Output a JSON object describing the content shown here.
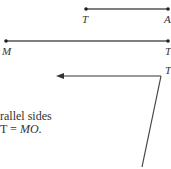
{
  "diagram": {
    "segment_ta": {
      "start_label": "T",
      "end_label": "A"
    },
    "segment_mt": {
      "start_label": "M",
      "end_label": "T"
    },
    "arrow_label": "T",
    "caption": {
      "line1": "rallel sides",
      "line2_prefix": "T = ",
      "line2_italic": "MO",
      "line2_suffix": "."
    },
    "colors": {
      "line": "#555555",
      "point": "#222222",
      "text": "#333333"
    }
  }
}
